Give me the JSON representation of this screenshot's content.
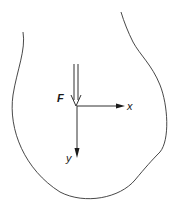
{
  "diagram": {
    "type": "free-body diagram",
    "body": {
      "shape": "irregular closed contour (open at top)",
      "stroke_color": "#333333"
    },
    "force": {
      "label": "F",
      "style": "double-line arrow",
      "direction": "down (toward origin)"
    },
    "axes": {
      "x": {
        "label": "x",
        "direction": "right"
      },
      "y": {
        "label": "y",
        "direction": "down"
      }
    },
    "colors": {
      "ink": "#1a1a1a",
      "background": "#ffffff"
    }
  }
}
